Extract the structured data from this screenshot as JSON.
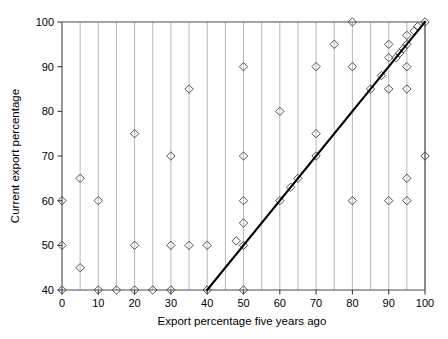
{
  "chart_data": {
    "type": "scatter",
    "title": "",
    "xlabel": "Export percentage five years ago",
    "ylabel": "Current export percentage",
    "xlim": [
      0,
      100
    ],
    "ylim": [
      40,
      100
    ],
    "xticks": [
      0,
      10,
      20,
      30,
      40,
      50,
      60,
      70,
      80,
      90,
      100
    ],
    "yticks": [
      40,
      50,
      60,
      70,
      80,
      90,
      100
    ],
    "xtick_labels": [
      "0",
      "10",
      "20",
      "30",
      "40",
      "50",
      "60",
      "70",
      "80",
      "90",
      "100"
    ],
    "ytick_labels": [
      "40",
      "50",
      "60",
      "70",
      "80",
      "90",
      "100"
    ],
    "grid": "vertical gridlines every 5 units from 0 to 100",
    "grid_x_step": 5,
    "legend": null,
    "marker_style": "open diamond",
    "points": [
      [
        0,
        60
      ],
      [
        0,
        50
      ],
      [
        0,
        40
      ],
      [
        5,
        65
      ],
      [
        5,
        45
      ],
      [
        10,
        60
      ],
      [
        10,
        40
      ],
      [
        15,
        40
      ],
      [
        20,
        75
      ],
      [
        20,
        50
      ],
      [
        20,
        40
      ],
      [
        25,
        40
      ],
      [
        30,
        70
      ],
      [
        30,
        50
      ],
      [
        30,
        40
      ],
      [
        35,
        85
      ],
      [
        35,
        50
      ],
      [
        40,
        50
      ],
      [
        40,
        40
      ],
      [
        48,
        51
      ],
      [
        50,
        90
      ],
      [
        50,
        70
      ],
      [
        50,
        60
      ],
      [
        50,
        55
      ],
      [
        50,
        50
      ],
      [
        50,
        40
      ],
      [
        60,
        80
      ],
      [
        60,
        60
      ],
      [
        63,
        63
      ],
      [
        65,
        65
      ],
      [
        70,
        90
      ],
      [
        70,
        75
      ],
      [
        70,
        70
      ],
      [
        75,
        95
      ],
      [
        80,
        100
      ],
      [
        80,
        90
      ],
      [
        80,
        60
      ],
      [
        85,
        85
      ],
      [
        88,
        88
      ],
      [
        90,
        95
      ],
      [
        90,
        92
      ],
      [
        90,
        85
      ],
      [
        90,
        60
      ],
      [
        92,
        92
      ],
      [
        93,
        93
      ],
      [
        94,
        94
      ],
      [
        95,
        97
      ],
      [
        95,
        95
      ],
      [
        95,
        90
      ],
      [
        95,
        85
      ],
      [
        95,
        65
      ],
      [
        95,
        60
      ],
      [
        97,
        98
      ],
      [
        98,
        99
      ],
      [
        100,
        100
      ],
      [
        100,
        70
      ]
    ],
    "fit_line": {
      "type": "line",
      "from": [
        40,
        40
      ],
      "to": [
        100,
        100
      ],
      "description": "regression / identity reference line"
    }
  },
  "axes": {
    "x_title": "Export percentage five years ago",
    "y_title": "Current export percentage"
  },
  "colors": {
    "marker_stroke": "#3f3f3f",
    "gridline": "#9a9a9a",
    "axis": "#4a4a4a",
    "fit_line": "#000000",
    "background": "#ffffff"
  }
}
